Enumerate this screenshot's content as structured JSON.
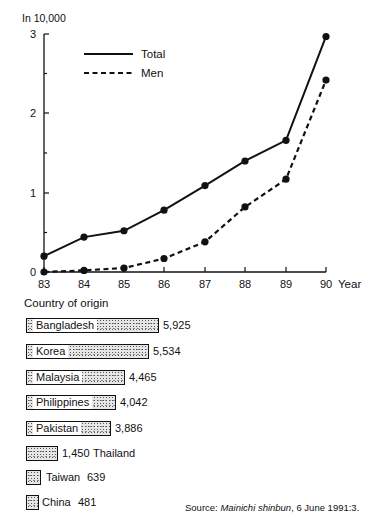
{
  "line_chart": {
    "y_unit_label": "In   10,000",
    "y_ticks": [
      "0",
      "1",
      "2",
      "3"
    ],
    "x_ticks": [
      "83",
      "84",
      "85",
      "86",
      "87",
      "88",
      "89",
      "90"
    ],
    "x_axis_label": "Year",
    "legend": {
      "total": "Total",
      "men": "Men"
    }
  },
  "bar_chart": {
    "title": "Country of origin",
    "items": [
      {
        "country": "Bangladesh",
        "value": "5,925"
      },
      {
        "country": "Korea",
        "value": "5,534"
      },
      {
        "country": "Malaysia",
        "value": "4,465"
      },
      {
        "country": "Philippines",
        "value": "4,042"
      },
      {
        "country": "Pakistan",
        "value": "3,886"
      },
      {
        "country": "Thailand",
        "value": "1,450"
      },
      {
        "country": "Taiwan",
        "value": "639"
      },
      {
        "country": "China",
        "value": "481"
      }
    ]
  },
  "source": {
    "prefix": "Source: ",
    "publication": "Mainichi shinbun",
    "suffix": ", 6 June 1991:3."
  },
  "chart_data": [
    {
      "type": "line",
      "title": "",
      "xlabel": "Year",
      "ylabel": "In 10,000",
      "x": [
        "83",
        "84",
        "85",
        "86",
        "87",
        "88",
        "89",
        "90"
      ],
      "series": [
        {
          "name": "Total",
          "style": "solid",
          "values": [
            0.2,
            0.44,
            0.52,
            0.78,
            1.09,
            1.4,
            1.66,
            2.97
          ]
        },
        {
          "name": "Men",
          "style": "dashed",
          "values": [
            0.0,
            0.02,
            0.05,
            0.17,
            0.38,
            0.82,
            1.17,
            2.42
          ]
        }
      ],
      "ylim": [
        0,
        3
      ],
      "grid": false,
      "legend_position": "upper-left inside"
    },
    {
      "type": "bar",
      "orientation": "horizontal",
      "title": "Country of origin",
      "categories": [
        "Bangladesh",
        "Korea",
        "Malaysia",
        "Philippines",
        "Pakistan",
        "Thailand",
        "Taiwan",
        "China"
      ],
      "values": [
        5925,
        5534,
        4465,
        4042,
        3886,
        1450,
        639,
        481
      ],
      "annotation": "Source: Mainichi shinbun, 6 June 1991:3."
    }
  ]
}
